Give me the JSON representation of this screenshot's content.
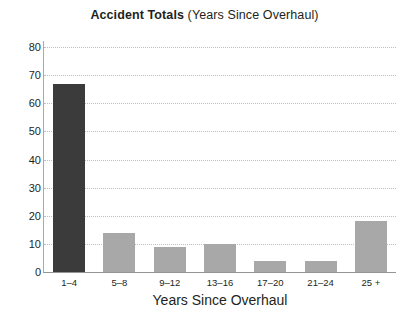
{
  "chart_data": {
    "type": "bar",
    "title": "Accident Totals (Years Since Overhaul)",
    "title_main": "Accident Totals",
    "title_sub": " (Years Since Overhaul)",
    "categories": [
      "1–4",
      "5–8",
      "9–12",
      "13–16",
      "17–20",
      "21–24",
      "25 +"
    ],
    "values": [
      67,
      14,
      9,
      10,
      4,
      4,
      18
    ],
    "xlabel": "Years Since Overhaul",
    "ylabel": "",
    "ylim": [
      0,
      80
    ],
    "ytick_step": 10,
    "ytick_labels": [
      "0",
      "10",
      "20",
      "30",
      "40",
      "50",
      "60",
      "70",
      "80"
    ],
    "ytick_values": [
      0,
      10,
      20,
      30,
      40,
      50,
      60,
      70,
      80
    ],
    "grid": "horizontal-dotted",
    "legend": "none",
    "bar_colors": [
      "#3b3b3b",
      "#a8a8a8",
      "#a8a8a8",
      "#a8a8a8",
      "#a8a8a8",
      "#a8a8a8",
      "#a8a8a8"
    ],
    "highlight_color": "#3b3b3b",
    "default_bar_color": "#a8a8a8",
    "gridline_color": "#bcbec0",
    "axis_color": "#939598",
    "text_color": "#231f20",
    "background_color": "#ffffff"
  }
}
